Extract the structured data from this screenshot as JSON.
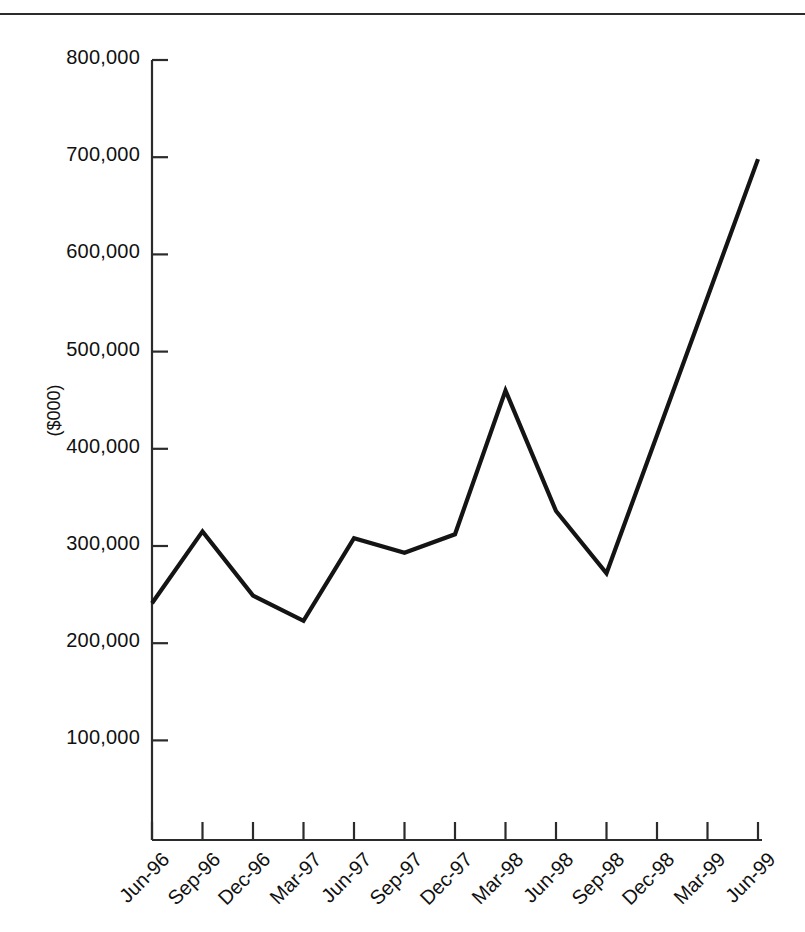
{
  "figure": {
    "clipped_title": "",
    "y_axis_title": "($000)"
  },
  "chart_data": {
    "type": "line",
    "title": "",
    "xlabel": "",
    "ylabel": "($000)",
    "ylim": [
      0,
      800000
    ],
    "grid": false,
    "legend": "none",
    "categories": [
      "Jun-96",
      "Sep-96",
      "Dec-96",
      "Mar-97",
      "Jun-97",
      "Sep-97",
      "Dec-97",
      "Mar-98",
      "Jun-98",
      "Sep-98",
      "Dec-98",
      "Mar-99",
      "Jun-99"
    ],
    "values": [
      241000,
      315000,
      249000,
      223000,
      308000,
      293000,
      312000,
      460000,
      336000,
      272000,
      414000,
      556000,
      698000
    ],
    "y_ticks": [
      100000,
      200000,
      300000,
      400000,
      500000,
      600000,
      700000,
      800000
    ],
    "y_tick_labels": [
      "100,000",
      "200,000",
      "300,000",
      "400,000",
      "500,000",
      "600,000",
      "700,000",
      "800,000"
    ],
    "series": [
      {
        "name": "series-1",
        "color": "#141414",
        "values": [
          241000,
          315000,
          249000,
          223000,
          308000,
          293000,
          312000,
          460000,
          336000,
          272000,
          414000,
          556000,
          698000
        ]
      }
    ]
  }
}
